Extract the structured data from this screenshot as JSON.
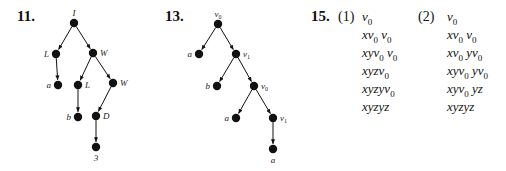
{
  "problems": [
    {
      "number": "11.",
      "tree": {
        "nodes": [
          {
            "id": "n0",
            "label": "I",
            "x": 74,
            "y": 23,
            "label_pos": "above"
          },
          {
            "id": "n1",
            "label": "L",
            "x": 56,
            "y": 54,
            "label_pos": "left"
          },
          {
            "id": "n2",
            "label": "W",
            "x": 93,
            "y": 53,
            "label_pos": "right"
          },
          {
            "id": "n3",
            "label": "a",
            "x": 58,
            "y": 85,
            "label_pos": "left"
          },
          {
            "id": "n4",
            "label": "L",
            "x": 78,
            "y": 85,
            "label_pos": "right"
          },
          {
            "id": "n5",
            "label": "W",
            "x": 113,
            "y": 83,
            "label_pos": "right"
          },
          {
            "id": "n6",
            "label": "b",
            "x": 78,
            "y": 117,
            "label_pos": "left"
          },
          {
            "id": "n7",
            "label": "D",
            "x": 96,
            "y": 116,
            "label_pos": "right"
          },
          {
            "id": "n8",
            "label": "3",
            "x": 96,
            "y": 147,
            "label_pos": "below"
          }
        ],
        "edges": [
          [
            "n0",
            "n1"
          ],
          [
            "n0",
            "n2"
          ],
          [
            "n1",
            "n3"
          ],
          [
            "n2",
            "n4"
          ],
          [
            "n2",
            "n5"
          ],
          [
            "n4",
            "n6"
          ],
          [
            "n5",
            "n7"
          ],
          [
            "n7",
            "n8"
          ]
        ]
      }
    },
    {
      "number": "13.",
      "tree": {
        "nodes": [
          {
            "id": "m0",
            "label": "v0",
            "x": 218,
            "y": 24,
            "label_pos": "above"
          },
          {
            "id": "m1",
            "label": "a",
            "x": 199,
            "y": 54,
            "label_pos": "left"
          },
          {
            "id": "m2",
            "label": "v1",
            "x": 236,
            "y": 54,
            "label_pos": "right"
          },
          {
            "id": "m3",
            "label": "b",
            "x": 217,
            "y": 86,
            "label_pos": "left"
          },
          {
            "id": "m4",
            "label": "v0",
            "x": 254,
            "y": 86,
            "label_pos": "right"
          },
          {
            "id": "m5",
            "label": "a",
            "x": 236,
            "y": 118,
            "label_pos": "left"
          },
          {
            "id": "m6",
            "label": "v1",
            "x": 273,
            "y": 118,
            "label_pos": "right"
          },
          {
            "id": "m7",
            "label": "a",
            "x": 273,
            "y": 149,
            "label_pos": "below"
          }
        ],
        "edges": [
          [
            "m0",
            "m1"
          ],
          [
            "m0",
            "m2"
          ],
          [
            "m2",
            "m3"
          ],
          [
            "m2",
            "m4"
          ],
          [
            "m4",
            "m5"
          ],
          [
            "m4",
            "m6"
          ],
          [
            "m6",
            "m7"
          ]
        ]
      }
    },
    {
      "number": "15.",
      "parts": [
        {
          "label": "(1)",
          "derivation": [
            [
              {
                "t": "v"
              },
              {
                "s": "0"
              }
            ],
            [
              {
                "t": "xv"
              },
              {
                "s": "0"
              },
              {
                "t": " v"
              },
              {
                "s": "0"
              }
            ],
            [
              {
                "t": "xyv"
              },
              {
                "s": "0"
              },
              {
                "t": " v"
              },
              {
                "s": "0"
              }
            ],
            [
              {
                "t": "xyzv"
              },
              {
                "s": "0"
              }
            ],
            [
              {
                "t": "xyzyv"
              },
              {
                "s": "0"
              }
            ],
            [
              {
                "t": "xyzyz"
              }
            ]
          ]
        },
        {
          "label": "(2)",
          "derivation": [
            [
              {
                "t": "v"
              },
              {
                "s": "0"
              }
            ],
            [
              {
                "t": "xv"
              },
              {
                "s": "0"
              },
              {
                "t": " v"
              },
              {
                "s": "0"
              }
            ],
            [
              {
                "t": "xv"
              },
              {
                "s": "0"
              },
              {
                "t": " yv"
              },
              {
                "s": "0"
              }
            ],
            [
              {
                "t": "xyv"
              },
              {
                "s": "0"
              },
              {
                "t": " yv"
              },
              {
                "s": "0"
              }
            ],
            [
              {
                "t": "xyv"
              },
              {
                "s": "0"
              },
              {
                "t": " yz"
              }
            ],
            [
              {
                "t": "xyzyz"
              }
            ]
          ]
        }
      ]
    }
  ]
}
